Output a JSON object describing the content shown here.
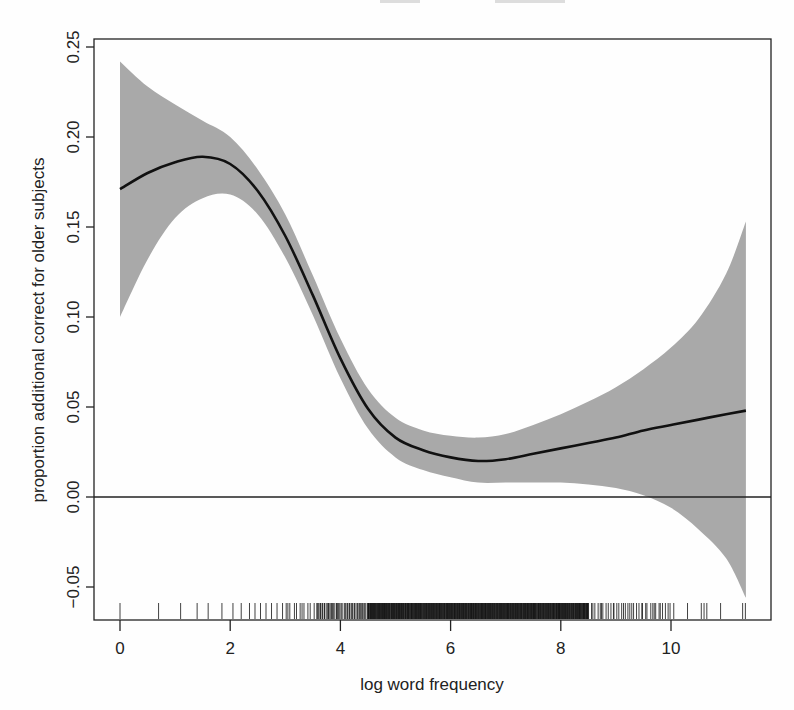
{
  "chart_data": {
    "type": "line",
    "subtype": "smooth fit with confidence band and rug",
    "title": "",
    "xlabel": "log word frequency",
    "ylabel": "proportion additional correct for older subjects",
    "xlim": [
      -0.45,
      11.95
    ],
    "ylim": [
      -0.068,
      0.254
    ],
    "x_ticks": [
      0,
      2,
      4,
      6,
      8,
      10
    ],
    "x_tick_labels": [
      "0",
      "2",
      "4",
      "6",
      "8",
      "10"
    ],
    "y_ticks": [
      -0.05,
      0.0,
      0.05,
      0.1,
      0.15,
      0.2,
      0.25
    ],
    "y_tick_labels": [
      "-0.05",
      "0.00",
      "0.05",
      "0.10",
      "0.15",
      "0.20",
      "0.25"
    ],
    "grid": false,
    "legend": null,
    "reference_line": {
      "y": 0.0,
      "label": ""
    },
    "colors": {
      "band": "#a9a9a9",
      "line": "#111111",
      "axes": "#222222"
    },
    "series": [
      {
        "name": "fit",
        "x": [
          0.0,
          0.5,
          1.0,
          1.5,
          2.0,
          2.5,
          3.0,
          3.5,
          4.0,
          4.5,
          5.0,
          5.5,
          6.0,
          6.5,
          7.0,
          7.5,
          8.0,
          8.5,
          9.0,
          9.5,
          10.0,
          10.5,
          11.0,
          11.36
        ],
        "y": [
          0.171,
          0.18,
          0.186,
          0.189,
          0.185,
          0.17,
          0.145,
          0.112,
          0.077,
          0.049,
          0.033,
          0.026,
          0.022,
          0.02,
          0.021,
          0.024,
          0.027,
          0.03,
          0.033,
          0.037,
          0.04,
          0.043,
          0.046,
          0.048
        ],
        "upper": [
          0.242,
          0.228,
          0.218,
          0.209,
          0.2,
          0.182,
          0.157,
          0.123,
          0.088,
          0.06,
          0.044,
          0.037,
          0.034,
          0.033,
          0.035,
          0.04,
          0.046,
          0.053,
          0.061,
          0.071,
          0.083,
          0.099,
          0.124,
          0.153
        ],
        "lower": [
          0.1,
          0.132,
          0.155,
          0.166,
          0.168,
          0.157,
          0.133,
          0.101,
          0.066,
          0.038,
          0.022,
          0.015,
          0.011,
          0.008,
          0.008,
          0.008,
          0.008,
          0.007,
          0.005,
          0.001,
          -0.006,
          -0.018,
          -0.034,
          -0.056
        ]
      }
    ],
    "rug": {
      "description": "tick marks for each observed x value; sparse below 3, very dense 4.5-8.5, sparse above 10",
      "sparse_left": [
        0.0,
        0.7,
        1.1,
        1.4,
        1.6,
        1.85,
        2.05,
        2.2,
        2.35,
        2.45,
        2.55,
        2.65,
        2.75,
        2.85,
        2.95
      ],
      "sparse_right": [
        10.05,
        10.3,
        10.55,
        10.6,
        10.65,
        10.9,
        11.3,
        11.35
      ],
      "dense_segments": [
        {
          "from": 3.0,
          "to": 3.6,
          "step": 0.05
        },
        {
          "from": 3.6,
          "to": 4.5,
          "step": 0.02
        },
        {
          "from": 4.5,
          "to": 8.5,
          "step": 0.008
        },
        {
          "from": 8.5,
          "to": 10.0,
          "step": 0.04
        }
      ]
    }
  }
}
